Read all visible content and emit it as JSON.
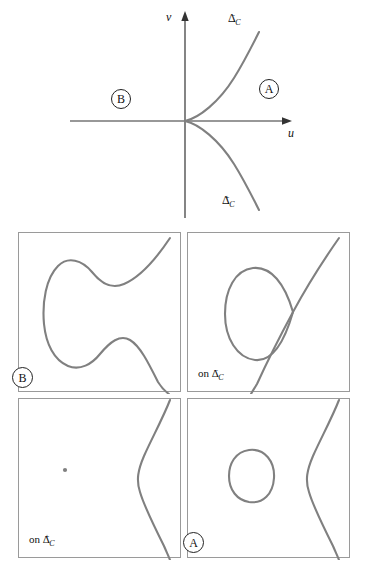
{
  "figure": {
    "top_diagram": {
      "axes": {
        "x_label": "u",
        "y_label": "v"
      },
      "curve_labels": [
        {
          "id": "delta-minus",
          "base": "Δ",
          "sub": "C",
          "sup": "−"
        },
        {
          "id": "delta-plus",
          "base": "Δ",
          "sub": "C",
          "sup": "+"
        }
      ],
      "regions": [
        {
          "id": "region-a",
          "label": "A"
        },
        {
          "id": "region-b",
          "label": "B"
        }
      ]
    },
    "panels": [
      {
        "id": "panel-b",
        "tag_kind": "circle",
        "tag": "B",
        "description": "two smooth branches, left branch C-shaped"
      },
      {
        "id": "panel-delta-minus",
        "tag_kind": "text",
        "tag_prefix": "on ",
        "tag_base": "Δ",
        "tag_sub": "C",
        "tag_sup": "−",
        "description": "nodal curve: oval loop crossed by a diagonal branch"
      },
      {
        "id": "panel-delta-plus",
        "tag_kind": "text",
        "tag_prefix": "on ",
        "tag_base": "Δ",
        "tag_sub": "C",
        "tag_sup": "+",
        "description": "isolated point plus a single S-shaped branch"
      },
      {
        "id": "panel-a",
        "tag_kind": "circle",
        "tag": "A",
        "description": "small closed oval plus a single S-shaped branch"
      }
    ]
  },
  "colors": {
    "curve": "#808080",
    "axis": "#333333",
    "panel_border": "#9a9a9a",
    "background": "#ffffff",
    "text": "#111111"
  }
}
